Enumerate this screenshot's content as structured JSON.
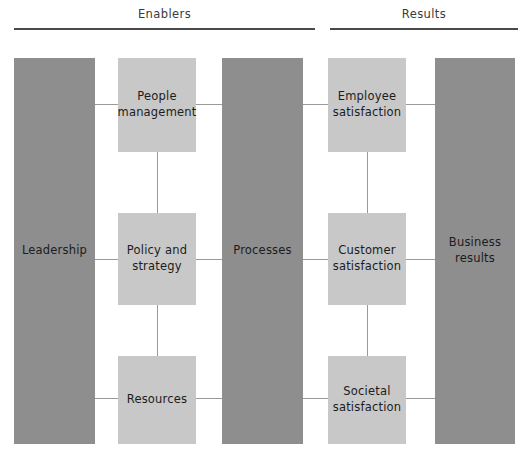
{
  "diagram": {
    "width": 527,
    "height": 463,
    "colors": {
      "pillar_fill": "#8e8e8e",
      "criterion_fill": "#c8c8c8",
      "connector": "#9a9a9a",
      "rule": "#4a4a4a",
      "background": "#ffffff",
      "text": "#1c1c1c"
    }
  },
  "sections": {
    "enablers": {
      "label": "Enablers"
    },
    "results": {
      "label": "Results"
    }
  },
  "nodes": {
    "leadership": {
      "label": "Leadership",
      "group": "enablers",
      "style": "pillar"
    },
    "people_management": {
      "label": "People\nmanagement",
      "group": "enablers",
      "style": "criterion"
    },
    "policy_and_strategy": {
      "label": "Policy and\nstrategy",
      "group": "enablers",
      "style": "criterion"
    },
    "resources": {
      "label": "Resources",
      "group": "enablers",
      "style": "criterion"
    },
    "processes": {
      "label": "Processes",
      "group": "enablers",
      "style": "pillar"
    },
    "employee_satisfaction": {
      "label": "Employee\nsatisfaction",
      "group": "results",
      "style": "criterion"
    },
    "customer_satisfaction": {
      "label": "Customer\nsatisfaction",
      "group": "results",
      "style": "criterion"
    },
    "societal_satisfaction": {
      "label": "Societal\nsatisfaction",
      "group": "results",
      "style": "criterion"
    },
    "business_results": {
      "label": "Business\nresults",
      "group": "results",
      "style": "pillar"
    }
  }
}
